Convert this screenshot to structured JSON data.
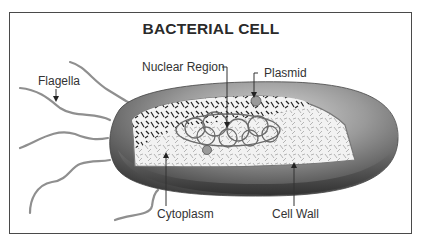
{
  "diagram": {
    "title": "BACTERIAL CELL",
    "labels": {
      "flagella": "Flagella",
      "nuclear_region": "Nuclear Region",
      "plasmid": "Plasmid",
      "cytoplasm": "Cytoplasm",
      "cell_wall": "Cell Wall"
    },
    "colors": {
      "frame": "#4a4a4a",
      "cell_wall_dark": "#3c3c3c",
      "cell_wall_light": "#a8a8a8",
      "flagella": "#8a8a8a",
      "text": "#333333"
    }
  }
}
